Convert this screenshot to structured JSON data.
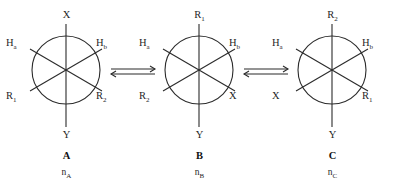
{
  "diagram": {
    "type": "newman-projection-equilibrium",
    "structures": [
      {
        "id": "A",
        "name": "A",
        "population": "n",
        "population_sub": "A",
        "substituents": {
          "top": {
            "text": "X",
            "sub": ""
          },
          "upper_left": {
            "text": "H",
            "sub": "a"
          },
          "upper_right": {
            "text": "H",
            "sub": "b"
          },
          "lower_left": {
            "text": "R",
            "sub": "1"
          },
          "lower_right": {
            "text": "R",
            "sub": "2"
          },
          "bottom": {
            "text": "Y",
            "sub": ""
          }
        }
      },
      {
        "id": "B",
        "name": "B",
        "population": "n",
        "population_sub": "B",
        "substituents": {
          "top": {
            "text": "R",
            "sub": "1"
          },
          "upper_left": {
            "text": "H",
            "sub": "a"
          },
          "upper_right": {
            "text": "H",
            "sub": "b"
          },
          "lower_left": {
            "text": "R",
            "sub": "2"
          },
          "lower_right": {
            "text": "X",
            "sub": ""
          },
          "bottom": {
            "text": "Y",
            "sub": ""
          }
        }
      },
      {
        "id": "C",
        "name": "C",
        "population": "n",
        "population_sub": "C",
        "substituents": {
          "top": {
            "text": "R",
            "sub": "2"
          },
          "upper_left": {
            "text": "H",
            "sub": "a"
          },
          "upper_right": {
            "text": "H",
            "sub": "b"
          },
          "lower_left": {
            "text": "X",
            "sub": ""
          },
          "lower_right": {
            "text": "R",
            "sub": "1"
          },
          "bottom": {
            "text": "Y",
            "sub": ""
          }
        }
      }
    ],
    "arrows": [
      {
        "id": "equilibrium-a-b",
        "kind": "equilibrium-double-arrow"
      },
      {
        "id": "equilibrium-b-c",
        "kind": "equilibrium-double-arrow"
      }
    ],
    "colors": {
      "stroke": "#2b2b2b",
      "text": "#1f1f1f",
      "background": "#ffffff"
    }
  }
}
